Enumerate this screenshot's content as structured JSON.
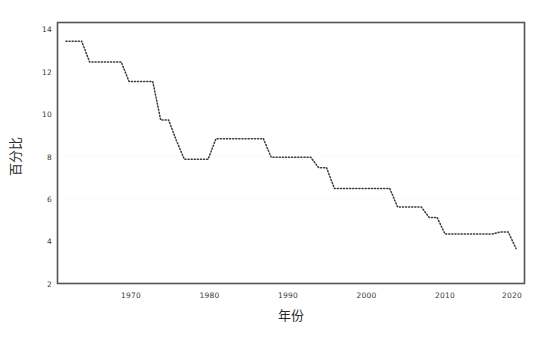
{
  "chart_data": {
    "type": "line",
    "title": "",
    "subtitle": "",
    "xlabel": "年份",
    "ylabel": "百分比",
    "xlim": [
      1962,
      2021
    ],
    "ylim": [
      2,
      14.6
    ],
    "xticks": [
      1970,
      1980,
      1990,
      2000,
      2010,
      2020
    ],
    "xtick_labels": [
      "1970",
      "1980",
      "1990",
      "2000",
      "2010",
      "2020"
    ],
    "yticks": [
      2,
      4,
      6,
      8,
      10,
      12,
      14
    ],
    "ytick_labels": [
      "2",
      "4",
      "6",
      "8",
      "10",
      "12",
      "14"
    ],
    "grid": false,
    "legend": null,
    "line_style": "dotted",
    "line_color": "#3a3a3a",
    "frame_color": "#555555",
    "background_color": "#ffffff",
    "series": [
      {
        "name": "百分比",
        "x": [
          1963,
          1964,
          1965,
          1966,
          1967,
          1968,
          1969,
          1970,
          1971,
          1972,
          1973,
          1974,
          1975,
          1976,
          1977,
          1978,
          1979,
          1980,
          1981,
          1982,
          1983,
          1984,
          1985,
          1986,
          1987,
          1988,
          1989,
          1990,
          1991,
          1992,
          1993,
          1994,
          1995,
          1996,
          1997,
          1998,
          1999,
          2000,
          2001,
          2002,
          2003,
          2004,
          2005,
          2006,
          2007,
          2008,
          2009,
          2010,
          2011,
          2012,
          2013,
          2014,
          2015,
          2016,
          2017,
          2018,
          2019,
          2020
        ],
        "values": [
          13.7,
          13.7,
          13.7,
          12.7,
          12.7,
          12.7,
          12.7,
          12.7,
          11.75,
          11.75,
          11.75,
          11.75,
          9.9,
          9.9,
          8.9,
          8.0,
          8.0,
          8.0,
          8.0,
          9.0,
          9.0,
          9.0,
          9.0,
          9.0,
          9.0,
          9.0,
          8.1,
          8.1,
          8.1,
          8.1,
          8.1,
          8.1,
          7.6,
          7.6,
          6.6,
          6.6,
          6.6,
          6.6,
          6.6,
          6.6,
          6.6,
          6.6,
          5.7,
          5.7,
          5.7,
          5.7,
          5.2,
          5.2,
          4.4,
          4.4,
          4.4,
          4.4,
          4.4,
          4.4,
          4.4,
          4.5,
          4.5,
          3.7
        ]
      }
    ]
  }
}
